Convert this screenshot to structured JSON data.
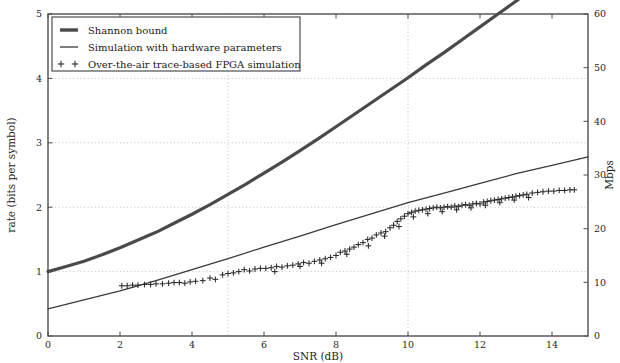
{
  "chart_data": {
    "type": "line",
    "title": "",
    "xlabel": "SNR (dB)",
    "ylabel": "rate (bits per symbol)",
    "y2label": "Mbps",
    "xlim": [
      0,
      15
    ],
    "ylim": [
      0,
      5
    ],
    "y2lim": [
      0,
      60
    ],
    "xticks": [
      0,
      2,
      4,
      6,
      8,
      10,
      12,
      14
    ],
    "xticklabels": [
      "0",
      "2",
      "4",
      "6",
      "8",
      "10",
      "12",
      "14"
    ],
    "yticks": [
      0,
      1,
      2,
      3,
      4,
      5
    ],
    "yticklabels": [
      "0",
      "1",
      "2",
      "3",
      "4",
      "5"
    ],
    "y2ticks": [
      0,
      10,
      20,
      30,
      40,
      50,
      60
    ],
    "y2ticklabels": [
      "0",
      "10",
      "20",
      "30",
      "40",
      "50",
      "60"
    ],
    "grid": "dotted major gridlines at x=5,10 and y=1,2,3,4",
    "legend_position": "upper left",
    "series": [
      {
        "name": "Shannon bound",
        "style": "thick-line",
        "color": "#4a4a4a",
        "x": [
          0,
          0.5,
          1,
          1.5,
          2,
          2.5,
          3,
          3.5,
          4,
          4.5,
          5,
          5.5,
          6,
          6.5,
          7,
          7.5,
          8,
          8.5,
          9,
          9.5,
          10,
          10.5,
          11,
          11.5,
          12,
          12.5,
          13,
          13.5,
          14,
          14.5,
          15
        ],
        "y": [
          1.0,
          1.08,
          1.16,
          1.26,
          1.37,
          1.49,
          1.61,
          1.75,
          1.89,
          2.04,
          2.2,
          2.36,
          2.53,
          2.7,
          2.88,
          3.06,
          3.25,
          3.44,
          3.63,
          3.82,
          4.01,
          4.21,
          4.4,
          4.6,
          4.8,
          5.0,
          5.2,
          5.4,
          5.6,
          5.8,
          6.0
        ]
      },
      {
        "name": "Simulation with hardware parameters",
        "style": "thin-line",
        "color": "#3a3a3a",
        "x": [
          0,
          1,
          2,
          3,
          4,
          5,
          6,
          7,
          8,
          9,
          10,
          11,
          12,
          13,
          14,
          15
        ],
        "y": [
          0.42,
          0.56,
          0.7,
          0.86,
          1.03,
          1.2,
          1.38,
          1.55,
          1.73,
          1.9,
          2.07,
          2.22,
          2.37,
          2.52,
          2.65,
          2.78
        ]
      },
      {
        "name": "Over-the-air trace-based FPGA simulation",
        "style": "plus-markers",
        "color": "#2b2b2b",
        "x": [
          2.05,
          2.2,
          2.35,
          2.5,
          2.68,
          2.85,
          3.0,
          3.18,
          3.35,
          3.5,
          3.65,
          3.8,
          3.95,
          4.1,
          4.3,
          4.5,
          4.65,
          4.85,
          5.0,
          5.15,
          5.3,
          5.45,
          5.6,
          5.75,
          5.9,
          6.05,
          6.2,
          6.35,
          6.5,
          6.65,
          6.8,
          6.95,
          7.1,
          7.25,
          7.4,
          7.55,
          7.7,
          7.85,
          8.0,
          8.12,
          8.25,
          8.38,
          8.5,
          8.62,
          8.75,
          8.88,
          9.0,
          9.12,
          9.25,
          9.38,
          9.5,
          9.6,
          9.7,
          9.8,
          9.9,
          10.0,
          10.1,
          10.2,
          10.3,
          10.4,
          10.5,
          10.6,
          10.7,
          10.8,
          10.9,
          11.0,
          11.1,
          11.2,
          11.3,
          11.4,
          11.5,
          11.6,
          11.7,
          11.8,
          11.9,
          12.0,
          12.1,
          12.2,
          12.3,
          12.4,
          12.5,
          12.6,
          12.7,
          12.8,
          12.9,
          13.0,
          13.1,
          13.2,
          13.3,
          13.45,
          13.6,
          13.75,
          13.9,
          14.05,
          14.2,
          14.35,
          14.5,
          14.62,
          6.3,
          7.0,
          7.6,
          8.3,
          8.9,
          9.35,
          9.75,
          10.15,
          10.55,
          10.95,
          11.35,
          11.75,
          12.15,
          12.55,
          12.95,
          13.35
        ],
        "y": [
          0.78,
          0.78,
          0.79,
          0.79,
          0.8,
          0.8,
          0.81,
          0.81,
          0.82,
          0.83,
          0.83,
          0.82,
          0.84,
          0.85,
          0.86,
          0.9,
          0.88,
          0.95,
          0.97,
          0.98,
          1.0,
          1.03,
          1.01,
          1.04,
          1.05,
          1.05,
          1.06,
          1.08,
          1.07,
          1.09,
          1.1,
          1.12,
          1.14,
          1.13,
          1.16,
          1.18,
          1.2,
          1.22,
          1.25,
          1.3,
          1.32,
          1.35,
          1.38,
          1.42,
          1.45,
          1.5,
          1.52,
          1.57,
          1.6,
          1.62,
          1.68,
          1.72,
          1.78,
          1.82,
          1.86,
          1.9,
          1.92,
          1.94,
          1.95,
          1.96,
          1.97,
          1.98,
          1.99,
          2.0,
          1.99,
          2.0,
          2.01,
          2.0,
          2.02,
          2.01,
          2.03,
          2.04,
          2.03,
          2.05,
          2.06,
          2.05,
          2.08,
          2.09,
          2.1,
          2.11,
          2.12,
          2.13,
          2.14,
          2.15,
          2.16,
          2.17,
          2.18,
          2.19,
          2.2,
          2.22,
          2.23,
          2.24,
          2.25,
          2.25,
          2.26,
          2.26,
          2.27,
          2.27,
          1.0,
          1.08,
          1.13,
          1.27,
          1.4,
          1.55,
          1.7,
          1.85,
          1.9,
          1.93,
          1.96,
          1.99,
          2.03,
          2.07,
          2.11,
          2.15
        ]
      }
    ]
  },
  "legend": {
    "items": [
      {
        "label": "Shannon bound",
        "marker": "thick-line"
      },
      {
        "label": "Simulation with hardware parameters",
        "marker": "thin-line"
      },
      {
        "label": "Over-the-air trace-based FPGA simulation",
        "marker": "plus-plus"
      }
    ]
  }
}
